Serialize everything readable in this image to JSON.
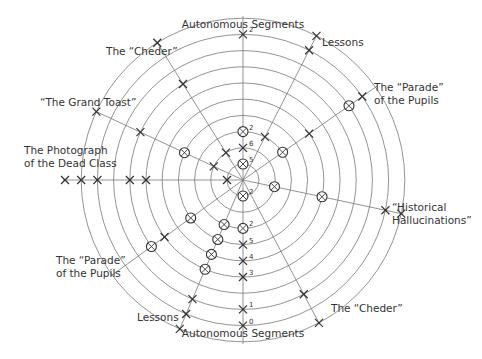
{
  "center": {
    "x": 243,
    "y": 180
  },
  "rings": {
    "count": 10,
    "inner_radius": 16,
    "step": 16.2
  },
  "colors": {
    "line": "#777777",
    "marker": "#333333",
    "text": "#333333",
    "background": "#ffffff"
  },
  "labels": {
    "top": "Autonomous Segments",
    "bottom": "Autonomous Segments",
    "lessons_top": "Lessons",
    "parade_right_1": "The “Parade”",
    "parade_right_2": "of the Pupils",
    "historical_1": "“Historical",
    "historical_2": "Hallucinations”",
    "cheder_bottom": "The “Cheder”",
    "lessons_bottom": "Lessons",
    "parade_left_1": "The “Parade”",
    "parade_left_2": "of the Pupils",
    "photograph_1": "The Photograph",
    "photograph_2": "of the Dead Class",
    "grand_toast": "“The Grand Toast”",
    "cheder_top": "The “Cheder”"
  },
  "axes": [
    {
      "name": "Autonomous Segments (top)",
      "angle_deg": -90,
      "markers": [
        {
          "ring": 9,
          "type": "x",
          "num": "2"
        },
        {
          "ring": 3,
          "type": "circle",
          "num": "2"
        },
        {
          "ring": 2,
          "type": "x",
          "num": "6"
        },
        {
          "ring": 1,
          "type": "circle",
          "num": "5"
        }
      ]
    },
    {
      "name": "Lessons (top-right)",
      "angle_deg": -63,
      "markers": [
        {
          "ring": 10,
          "type": "x"
        },
        {
          "ring": 9,
          "type": "x"
        },
        {
          "ring": 3,
          "type": "x"
        }
      ]
    },
    {
      "name": "The Parade of the Pupils (right)",
      "angle_deg": -35,
      "markers": [
        {
          "ring": 9,
          "type": "x"
        },
        {
          "ring": 8,
          "type": "circle"
        },
        {
          "ring": 5,
          "type": "x"
        },
        {
          "ring": 3,
          "type": "circle"
        }
      ]
    },
    {
      "name": "Historical Hallucinations",
      "angle_deg": 12,
      "markers": [
        {
          "ring": 10,
          "type": "x"
        },
        {
          "ring": 9,
          "type": "x"
        },
        {
          "ring": 5,
          "type": "circle"
        },
        {
          "ring": 2,
          "type": "circle"
        }
      ]
    },
    {
      "name": "The Cheder (bottom-right)",
      "angle_deg": 62,
      "markers": [
        {
          "ring": 10,
          "type": "x"
        },
        {
          "ring": 8,
          "type": "x"
        }
      ]
    },
    {
      "name": "Autonomous Segments (bottom)",
      "angle_deg": 90,
      "markers": [
        {
          "ring": 1,
          "type": "circle",
          "num": "2"
        },
        {
          "ring": 3,
          "type": "circle",
          "num": "2"
        },
        {
          "ring": 4,
          "type": "x",
          "num": "5"
        },
        {
          "ring": 5,
          "type": "x",
          "num": "4"
        },
        {
          "ring": 6,
          "type": "x",
          "num": "3"
        },
        {
          "ring": 8,
          "type": "x",
          "num": "1"
        },
        {
          "ring": 9,
          "type": "x",
          "num": "0"
        }
      ]
    },
    {
      "name": "Lessons (bottom-left)",
      "angle_deg": 113,
      "markers": [
        {
          "ring": 3,
          "type": "circle"
        },
        {
          "ring": 4,
          "type": "circle"
        },
        {
          "ring": 5,
          "type": "circle"
        },
        {
          "ring": 6,
          "type": "circle"
        },
        {
          "ring": 8,
          "type": "x"
        },
        {
          "ring": 9,
          "type": "x"
        },
        {
          "ring": 10,
          "type": "x"
        }
      ]
    },
    {
      "name": "The Parade of the Pupils (left)",
      "angle_deg": 144,
      "markers": [
        {
          "ring": 4,
          "type": "circle"
        },
        {
          "ring": 6,
          "type": "x"
        },
        {
          "ring": 7,
          "type": "circle"
        }
      ]
    },
    {
      "name": "The Photograph of the Dead Class",
      "angle_deg": 180,
      "markers": [
        {
          "ring": 1,
          "type": "x"
        },
        {
          "ring": 6,
          "type": "x"
        },
        {
          "ring": 7,
          "type": "x"
        },
        {
          "ring": 9,
          "type": "x"
        },
        {
          "ring": 10,
          "type": "x"
        },
        {
          "ring": 11,
          "type": "x"
        }
      ]
    },
    {
      "name": "The Grand Toast",
      "angle_deg": -155,
      "markers": [
        {
          "ring": 2,
          "type": "x"
        },
        {
          "ring": 4,
          "type": "circle"
        },
        {
          "ring": 7,
          "type": "x"
        },
        {
          "ring": 10,
          "type": "x"
        }
      ]
    },
    {
      "name": "The Cheder (top-left)",
      "angle_deg": -122,
      "markers": [
        {
          "ring": 2,
          "type": "x"
        },
        {
          "ring": 7,
          "type": "x"
        },
        {
          "ring": 10,
          "type": "x"
        }
      ]
    }
  ]
}
